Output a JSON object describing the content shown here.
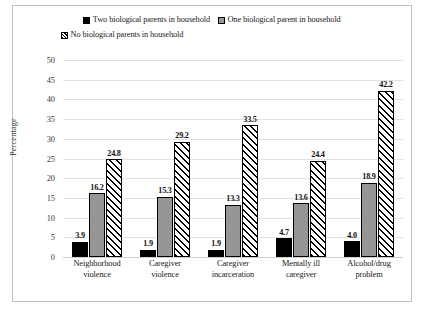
{
  "chart_data": {
    "type": "bar",
    "title": "",
    "xlabel": "",
    "ylabel": "Percentage",
    "ylim": [
      0,
      50
    ],
    "ytick_step": 5,
    "yticks": [
      "50",
      "45",
      "40",
      "35",
      "30",
      "25",
      "20",
      "15",
      "10",
      "5",
      "0"
    ],
    "grid": true,
    "legend_position": "top",
    "categories": [
      "Neighborhood violence",
      "Caregiver violence",
      "Caregiver incarceration",
      "Mentally ill caregiver",
      "Alcohol/drug problem"
    ],
    "category_lines": [
      [
        "Neighborhood",
        "violence"
      ],
      [
        "Caregiver",
        "violence"
      ],
      [
        "Caregiver",
        "incarceration"
      ],
      [
        "Mentally ill",
        "caregiver"
      ],
      [
        "Alcohol/drug",
        "problem"
      ]
    ],
    "series": [
      {
        "name": "Two biological parents in household",
        "pattern": "solid-black",
        "color": "#000000",
        "values": [
          3.9,
          1.9,
          1.9,
          4.7,
          4.0
        ],
        "labels": [
          "3.9",
          "1.9",
          "1.9",
          "4.7",
          "4.0"
        ]
      },
      {
        "name": "One biological parent in household",
        "pattern": "solid-gray",
        "color": "#969696",
        "values": [
          16.2,
          15.3,
          13.3,
          13.6,
          18.9
        ],
        "labels": [
          "16.2",
          "15.3",
          "13.3",
          "13.6",
          "18.9"
        ]
      },
      {
        "name": "No biological parents in household",
        "pattern": "diagonal-hatch",
        "color": "#ffffff",
        "values": [
          24.8,
          29.2,
          33.5,
          24.4,
          42.2
        ],
        "labels": [
          "24.8",
          "29.2",
          "33.5",
          "24.4",
          "42.2"
        ]
      }
    ]
  },
  "legend": {
    "row1": [
      "Two biological parents in household",
      "One biological parent in household"
    ],
    "row2": [
      "No biological parents in household"
    ]
  },
  "colors": {
    "series1": "#000000",
    "series2": "#969696",
    "series3": "#ffffff",
    "gridline": "#e2e2e2",
    "frame": "#bfbfbf"
  }
}
